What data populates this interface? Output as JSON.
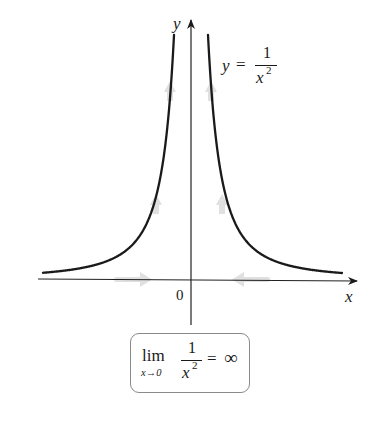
{
  "figure": {
    "function_label": {
      "lhs": "y",
      "eq": "=",
      "numerator": "1",
      "denominator_base": "x",
      "denominator_exp": "2"
    },
    "axes": {
      "x_label": "x",
      "y_label": "y",
      "origin_label": "0"
    },
    "limit_box": {
      "lim": "lim",
      "subscript": "x→0",
      "numerator": "1",
      "denominator_base": "x",
      "denominator_exp": "2",
      "eq": "=",
      "result": "∞"
    },
    "colors": {
      "curve": "#1a1a1a",
      "axis": "#222222",
      "arrow_hint": "#cfcfcf",
      "box_border": "#8a8a8a"
    }
  },
  "chart_data": {
    "type": "line",
    "xlabel": "x",
    "ylabel": "y",
    "function": "y = 1/x^2",
    "series": [
      {
        "name": "left branch (x<0)",
        "x": [
          -3,
          -2,
          -1.5,
          -1,
          -0.7,
          -0.5,
          -0.3,
          -0.2
        ],
        "y": [
          0.11,
          0.25,
          0.44,
          1,
          2.04,
          4,
          11.1,
          25
        ]
      },
      {
        "name": "right branch (x>0)",
        "x": [
          0.2,
          0.3,
          0.5,
          0.7,
          1,
          1.5,
          2,
          3
        ],
        "y": [
          25,
          11.1,
          4,
          2.04,
          1,
          0.44,
          0.25,
          0.11
        ]
      }
    ],
    "annotations": [
      "0",
      "lim_{x→0} 1/x² = ∞",
      "y = 1/x²"
    ],
    "arrows": [
      "x-axis arrows pointing toward 0 from both sides",
      "curve arrows pointing upward on both branches"
    ],
    "grid": false,
    "legend": null
  }
}
